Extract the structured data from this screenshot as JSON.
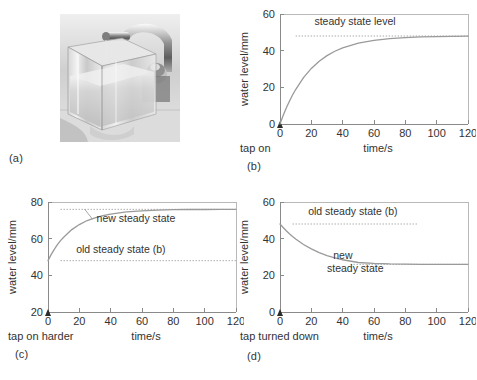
{
  "figure": {
    "panels": [
      {
        "id": "a",
        "label": "(a)",
        "type": "photo",
        "description": "photograph of a transparent square tank filling with water under a running tap"
      },
      {
        "id": "b",
        "label": "(b)",
        "type": "chart"
      },
      {
        "id": "c",
        "label": "(c)",
        "type": "chart"
      },
      {
        "id": "d",
        "label": "(d)",
        "type": "chart"
      }
    ]
  },
  "chart_data": [
    {
      "panel": "b",
      "type": "line",
      "title": "",
      "xlabel": "time/s",
      "ylabel": "water level/mm",
      "xlim": [
        0,
        120
      ],
      "ylim": [
        0,
        60
      ],
      "xticks": [
        0,
        20,
        40,
        60,
        80,
        100,
        120
      ],
      "yticks": [
        0,
        20,
        40,
        60
      ],
      "grid": false,
      "legend": "none",
      "origin_note": "tap on",
      "annotations": [
        {
          "text": "steady state level",
          "x": 22,
          "y": 54,
          "kind": "label"
        }
      ],
      "reference_lines": [
        {
          "name": "steady state level",
          "value": 48,
          "style": "dotted",
          "x_from": 10,
          "x_to": 120
        }
      ],
      "series": [
        {
          "name": "water level",
          "model": "rise",
          "start": 0,
          "asymptote": 48,
          "tau": 20,
          "x": [
            0,
            2,
            4,
            6,
            8,
            10,
            15,
            20,
            25,
            30,
            35,
            40,
            50,
            60,
            70,
            80,
            90,
            100,
            110,
            120
          ],
          "values": [
            0,
            4.6,
            8.7,
            12.4,
            15.8,
            18.8,
            25.3,
            30.3,
            34.2,
            37.3,
            39.7,
            41.5,
            44.1,
            45.6,
            46.6,
            47.1,
            47.5,
            47.7,
            47.8,
            47.9
          ]
        }
      ]
    },
    {
      "panel": "c",
      "type": "line",
      "title": "",
      "xlabel": "time/s",
      "ylabel": "water level/mm",
      "xlim": [
        0,
        120
      ],
      "ylim": [
        20,
        80
      ],
      "xticks": [
        0,
        20,
        40,
        60,
        80,
        100,
        120
      ],
      "yticks": [
        20,
        40,
        60,
        80
      ],
      "grid": false,
      "legend": "none",
      "origin_note": "tap on harder",
      "annotations": [
        {
          "text": "new steady state",
          "x": 31,
          "y": 69,
          "kind": "label-with-leader"
        },
        {
          "text": "old steady state (b)",
          "x": 18,
          "y": 52,
          "kind": "label"
        }
      ],
      "reference_lines": [
        {
          "name": "new steady state",
          "value": 76,
          "style": "dotted",
          "x_from": 8,
          "x_to": 120
        },
        {
          "name": "old steady state (b)",
          "value": 48,
          "style": "dotted",
          "x_from": 8,
          "x_to": 120
        }
      ],
      "series": [
        {
          "name": "water level",
          "model": "rise",
          "start": 48,
          "asymptote": 76,
          "tau": 16,
          "x": [
            0,
            2,
            4,
            6,
            8,
            10,
            15,
            20,
            25,
            30,
            35,
            40,
            50,
            60,
            70,
            80,
            90,
            100,
            110,
            120
          ],
          "values": [
            48,
            51.3,
            54.2,
            56.7,
            58.9,
            60.8,
            64.8,
            67.7,
            69.9,
            71.4,
            72.6,
            73.4,
            74.6,
            75.2,
            75.6,
            75.8,
            75.9,
            75.9,
            76,
            76
          ]
        }
      ]
    },
    {
      "panel": "d",
      "type": "line",
      "title": "",
      "xlabel": "time/s",
      "ylabel": "water level/mm",
      "xlim": [
        0,
        120
      ],
      "ylim": [
        0,
        60
      ],
      "xticks": [
        0,
        20,
        40,
        60,
        80,
        100,
        120
      ],
      "yticks": [
        0,
        20,
        40,
        60
      ],
      "grid": false,
      "legend": "none",
      "origin_note": "tap turned down",
      "annotations": [
        {
          "text": "old steady state (b)",
          "x": 18,
          "y": 53,
          "kind": "label"
        },
        {
          "text": "new",
          "x": 34,
          "y": 29,
          "kind": "label"
        },
        {
          "text": "steady state",
          "x": 30,
          "y": 22,
          "kind": "label"
        }
      ],
      "reference_lines": [
        {
          "name": "old steady state (b)",
          "value": 48,
          "style": "dotted",
          "x_from": 8,
          "x_to": 88
        },
        {
          "name": "new steady state",
          "value": 26,
          "style": "dotted",
          "x_from": 45,
          "x_to": 120
        }
      ],
      "series": [
        {
          "name": "water level",
          "model": "decay",
          "start": 48,
          "asymptote": 26,
          "tau": 22,
          "x": [
            0,
            2,
            4,
            6,
            8,
            10,
            15,
            20,
            25,
            30,
            35,
            40,
            50,
            60,
            70,
            80,
            90,
            100,
            110,
            120
          ],
          "values": [
            48,
            46.1,
            44.3,
            42.7,
            41.2,
            39.8,
            36.8,
            34.4,
            32.4,
            30.8,
            29.5,
            28.5,
            27,
            26.5,
            26.2,
            26.1,
            26,
            26,
            26,
            26
          ]
        }
      ]
    }
  ]
}
